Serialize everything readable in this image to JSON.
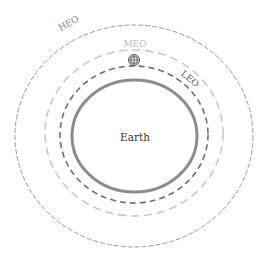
{
  "diagram": {
    "center": {
      "label": "Earth"
    },
    "orbits": [
      {
        "id": "leo",
        "label": "LEO"
      },
      {
        "id": "meo",
        "label": "MEO"
      },
      {
        "id": "heo",
        "label": "HEO"
      }
    ],
    "satellite": {
      "icon": "satellite-icon"
    }
  },
  "colors": {
    "earth_ring": "#8a8a8a",
    "leo": "#6e6e6e",
    "meo": "#c4c4c4",
    "heo": "#9a9a9a",
    "text_dark": "#333333",
    "text_light": "#b8b8b8"
  }
}
